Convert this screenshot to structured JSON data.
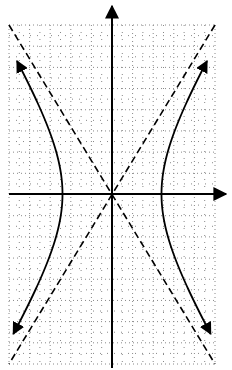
{
  "diagram": {
    "type": "hyperbola-graph",
    "grid": {
      "left": 9,
      "right": 215,
      "top": 25,
      "bottom": 364,
      "cols": 10,
      "rows": 16
    },
    "origin": {
      "x": 112,
      "y": 194
    },
    "vertex_offset_px": 49.5,
    "asymptote_slope": 1.64,
    "colors": {
      "grid": "#888888",
      "axis": "#000000",
      "curve": "#000000",
      "asymptote": "#000000"
    }
  }
}
